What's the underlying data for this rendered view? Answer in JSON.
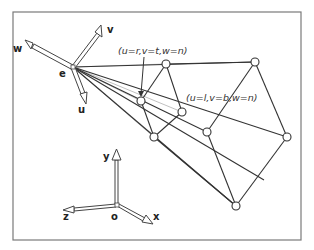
{
  "diagram": {
    "eye_frame": {
      "origin_label": "e",
      "axes": [
        {
          "name": "u",
          "label": "u"
        },
        {
          "name": "v",
          "label": "v"
        },
        {
          "name": "w",
          "label": "w"
        }
      ]
    },
    "world_frame": {
      "origin_label": "o",
      "axes": [
        {
          "name": "x",
          "label": "x"
        },
        {
          "name": "y",
          "label": "y"
        },
        {
          "name": "z",
          "label": "z"
        }
      ]
    },
    "annotations": [
      {
        "id": "near-top-right",
        "text": "(u=r,v=t,w=n)"
      },
      {
        "id": "near-bottom-left",
        "text": "(u=l,v=b,w=n)"
      }
    ],
    "colors": {
      "frame": "#7a7a7a",
      "edges": "#333333",
      "rays": "#b0b0b0",
      "background": "#ffffff"
    }
  }
}
